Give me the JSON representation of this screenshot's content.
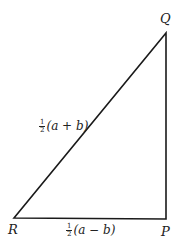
{
  "diagram": {
    "type": "right-triangle",
    "vertices": {
      "Q": {
        "label": "Q",
        "x": 166,
        "y": 33
      },
      "P": {
        "label": "P",
        "x": 166,
        "y": 219
      },
      "R": {
        "label": "R",
        "x": 14,
        "y": 218
      }
    },
    "edges": [
      {
        "from": "R",
        "to": "Q",
        "label": {
          "frac_num": "1",
          "frac_den": "2",
          "expr": "(a + b)"
        }
      },
      {
        "from": "R",
        "to": "P",
        "label": {
          "frac_num": "1",
          "frac_den": "2",
          "expr": "(a − b)"
        }
      },
      {
        "from": "P",
        "to": "Q",
        "label": null
      }
    ],
    "stroke_color": "#1a1a1a"
  }
}
